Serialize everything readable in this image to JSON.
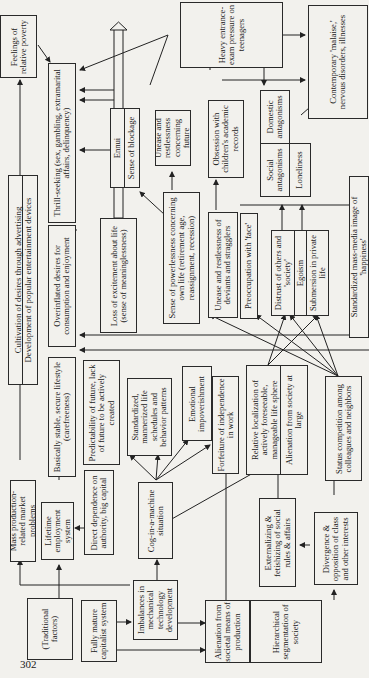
{
  "page_number": "302",
  "diagram": {
    "orientation": "rotated 90° counter-clockwise",
    "nodes": {
      "traditional_factors": "(Traditional factors)",
      "fully_mature_capitalist": "Fully mature capitalist system",
      "mass_production": "Mass production-related market problems",
      "lifetime_employment": "Lifetime employment system",
      "direct_dependence": "Direct dependence on authority, big capital",
      "imbalances": "Imbalances in mechanical technology development",
      "cog_in_machine": "Cog-in-a-machine situation",
      "alienation_production": "Alienation from societal means of production",
      "hierarchical": "Hierarchical segmentation of society",
      "externalizing": "Externalizing & fetishizing of social rules & affairs",
      "divergence": "Divergence & opposition of class and other interests",
      "cultivation": "Cultivation of desires through advertising",
      "development_entertainment": "Development of popular entertainment devices",
      "basically_stable": "Basically stable, secure lifestyle (carefreeness)",
      "predictability": "Predictability of future, lack of future to be actively created",
      "standardized": "Standardized, mannerized life schedules and behavior patterns",
      "emotional": "Emotional impoverishment",
      "forfeiture": "Forfeiture of independence in work",
      "relative_localization": "Relative localization of actively foreseeable, manageable life sphere",
      "alienation_society": "Alienation from society at large",
      "status_competition": "Status competition among colleagues and neighbors",
      "overinflated": "Overinflated desires for consumption and enjoyment",
      "loss_excitement": "Loss of excitement about life (sense of meaninglessness)",
      "sense_powerlessness": "Sense of powerlessness concerning own life (retirement age, reassignment, recession)",
      "unease_deviants": "Unease and restlessness of deviants and stragglers",
      "preoccupation_face": "Preoccupation with 'face'",
      "distrust": "Distrust of others and 'society'",
      "egoism": "Egoism",
      "submersion": "Submersion in private life",
      "standardized_media": "Standardized mass-media image of 'happiness'",
      "thrill_seeking": "Thrill-seeking (sex, gambling, extramarital affairs, delinquency)",
      "ennui": "Ennui",
      "sense_blockage": "Sense of blockage",
      "unease_future": "Unease and restlessness concerning future",
      "obsession": "Obsession with children's academic records",
      "social_antagonisms": "Social antagonisms",
      "domestic_antagonisms": "Domestic antagonisms",
      "loneliness": "Loneliness",
      "feelings_poverty": "Feelings of relative poverty",
      "heavy_exam": "Heavy entrance-exam pressure on teenagers",
      "contemporary_malaise": "Contemporary 'malaise,' nervous disorders, illnesses"
    }
  }
}
